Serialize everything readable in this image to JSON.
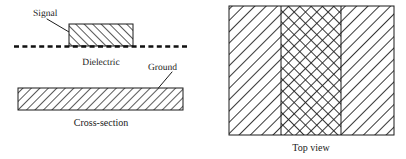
{
  "figure": {
    "colors": {
      "stroke": "#1a1a1a",
      "hatch": "#222222",
      "background": "#ffffff"
    },
    "cross_section": {
      "caption": "Cross-section",
      "signal_label": "Signal",
      "dielectric_label": "Dielectric",
      "ground_label": "Ground",
      "signal_hatch": "forward-diagonal-hatch",
      "ground_hatch": "backward-diagonal-hatch",
      "dielectric_style": "dashed-line"
    },
    "top_view": {
      "caption": "Top view",
      "bands": [
        {
          "name": "ground-left",
          "hatch": "backward-diagonal-hatch"
        },
        {
          "name": "signal-center",
          "hatch": "cross-hatch"
        },
        {
          "name": "ground-right",
          "hatch": "backward-diagonal-hatch"
        }
      ]
    }
  }
}
